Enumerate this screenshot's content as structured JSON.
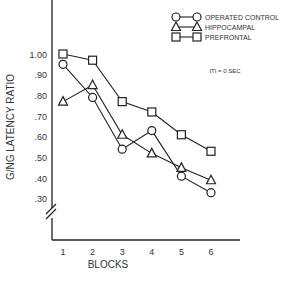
{
  "chart_data": {
    "type": "line",
    "title": "",
    "xlabel": "BLOCKS",
    "ylabel": "G/NG LATENCY RATIO",
    "categories": [
      "1",
      "2",
      "3",
      "4",
      "5",
      "6"
    ],
    "yticks": [
      ".30",
      ".40",
      ".50",
      ".60",
      ".70",
      ".80",
      ".90",
      "1.00"
    ],
    "ylim": [
      0.3,
      1.0
    ],
    "axis_break": true,
    "grid": false,
    "annotation": "ITI = 0 SEC",
    "legend_position": "top-right",
    "series": [
      {
        "name": "OPERATED CONTROL",
        "marker": "circle",
        "values": [
          0.95,
          0.79,
          0.54,
          0.63,
          0.41,
          0.33
        ]
      },
      {
        "name": "HIPPOCAMPAL",
        "marker": "triangle",
        "values": [
          0.77,
          0.85,
          0.61,
          0.52,
          0.45,
          0.39
        ]
      },
      {
        "name": "PREFRONTAL",
        "marker": "square",
        "values": [
          1.0,
          0.97,
          0.77,
          0.72,
          0.61,
          0.53
        ]
      }
    ]
  }
}
